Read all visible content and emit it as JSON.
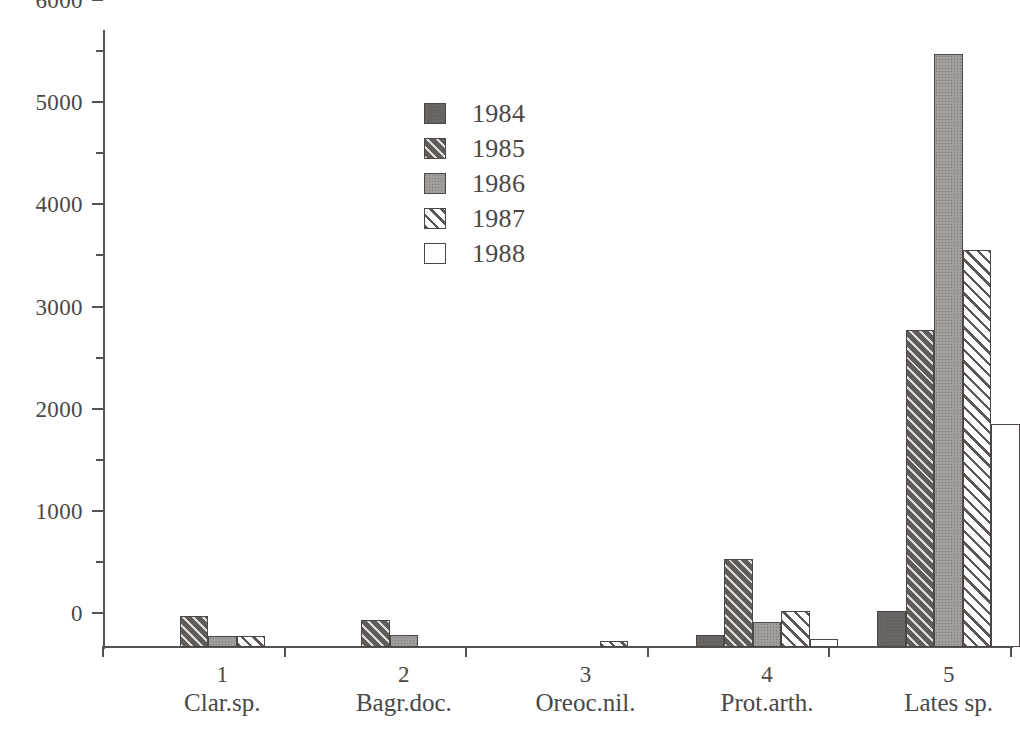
{
  "chart_data": {
    "type": "bar",
    "title": "",
    "subtitle": "",
    "xlabel": "",
    "ylabel": "",
    "ylim": [
      0,
      6000
    ],
    "y_major_step": 1000,
    "y_minor_step": 500,
    "grid": false,
    "legend_position": "inside-top-center",
    "categories": [
      "Clar.sp.",
      "Bagr.doc.",
      "Oreoc.nil.",
      "Prot.arth.",
      "Lates sp."
    ],
    "category_numbers": [
      "1",
      "2",
      "3",
      "4",
      "5"
    ],
    "y_tick_labels": [
      "0",
      "1000",
      "2000",
      "3000",
      "4000",
      "5000",
      "6000"
    ],
    "y_tick_values": [
      0,
      1000,
      2000,
      3000,
      4000,
      5000,
      6000
    ],
    "y_minor_tick_values": [
      500,
      1500,
      2500,
      3500,
      4500,
      5500
    ],
    "series": [
      {
        "name": "1984",
        "pattern": "solid-dark",
        "color": "#656260",
        "values": [
          0,
          0,
          0,
          120,
          350
        ]
      },
      {
        "name": "1985",
        "pattern": "dark-diagonal-hatch",
        "color": "#5f5c5a",
        "values": [
          300,
          265,
          0,
          860,
          3100
        ]
      },
      {
        "name": "1986",
        "pattern": "mid-gray",
        "color": "#a09d9a",
        "values": [
          110,
          120,
          0,
          240,
          5800
        ]
      },
      {
        "name": "1987",
        "pattern": "light-diagonal-hatch",
        "color": "#ffffff",
        "values": [
          105,
          0,
          60,
          350,
          3890
        ]
      },
      {
        "name": "1988",
        "pattern": "empty",
        "color": "#ffffff",
        "values": [
          0,
          0,
          0,
          80,
          2180
        ]
      }
    ]
  },
  "legend": {
    "entries": [
      {
        "label": "1984",
        "pattern": "solid-dark"
      },
      {
        "label": "1985",
        "pattern": "dark-diagonal-hatch"
      },
      {
        "label": "1986",
        "pattern": "mid-gray"
      },
      {
        "label": "1987",
        "pattern": "light-diagonal-hatch"
      },
      {
        "label": "1988",
        "pattern": "empty"
      }
    ]
  }
}
